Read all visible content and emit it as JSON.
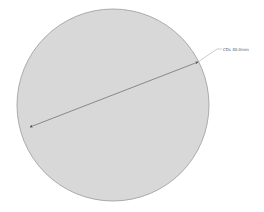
{
  "drawing": {
    "circle": {
      "cx": 113,
      "cy": 105,
      "r": 96,
      "fill": "#d8d8d8",
      "stroke": "#9a9a9a"
    },
    "dimension": {
      "label": "CDs 40.0mm",
      "line_color": "#666666",
      "leader_color": "#999999",
      "text_color": "#555555"
    }
  }
}
